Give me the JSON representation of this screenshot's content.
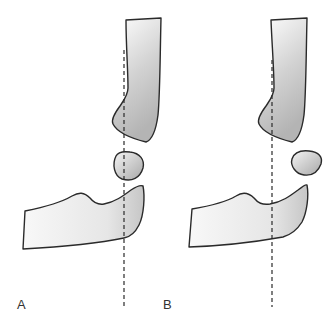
{
  "figure": {
    "panels": [
      {
        "id": "A",
        "label": "A",
        "description": "Elbow with vertical reference line passing through humerus, radial head and ulna"
      },
      {
        "id": "B",
        "label": "B",
        "description": "Elbow with vertical reference line along humeral shaft, radial head displaced laterally"
      }
    ],
    "colors": {
      "outline": "#2a2a2a",
      "fill_light": "#f7f7f7",
      "fill_dark": "#b8b8b8",
      "background": "#ffffff"
    }
  }
}
